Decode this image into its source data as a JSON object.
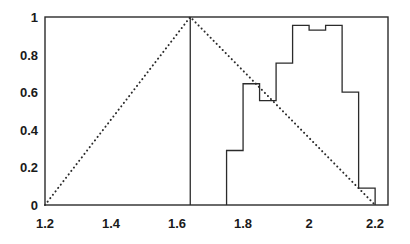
{
  "chart_data": {
    "type": "line",
    "title": "",
    "subtitle": "",
    "xlabel": "",
    "ylabel": "",
    "xlim": [
      1.2,
      2.239
    ],
    "ylim": [
      0,
      1
    ],
    "grid": false,
    "legend": null,
    "xticks": [
      1.2,
      1.4,
      1.6,
      1.8,
      2.0,
      2.2
    ],
    "xtick_labels": [
      "1.2",
      "1.4",
      "1.6",
      "1.8",
      "2",
      "2.2"
    ],
    "yticks": [
      0,
      0.2,
      0.4,
      0.6,
      0.8,
      1
    ],
    "ytick_labels": [
      "0",
      "0.2",
      "0.4",
      "0.6",
      "0.8",
      "1"
    ],
    "series": [
      {
        "name": "triangular-membership",
        "style": "dotted",
        "type": "line",
        "x": [
          1.2,
          1.64,
          2.2
        ],
        "values": [
          0,
          1,
          0
        ]
      },
      {
        "name": "empirical-histogram",
        "style": "solid-step",
        "type": "step",
        "bin_edges": [
          1.75,
          1.8,
          1.85,
          1.9,
          1.95,
          2.0,
          2.05,
          2.1,
          2.15,
          2.2
        ],
        "values": [
          0.29,
          0.645,
          0.555,
          0.755,
          0.955,
          0.93,
          0.955,
          0.6,
          0.09
        ]
      },
      {
        "name": "mode-vertical-line",
        "style": "solid-vertical",
        "type": "vline",
        "x": [
          1.64
        ],
        "values": [
          1
        ]
      }
    ]
  },
  "axes": {
    "x_tick_labels": [
      "1.2",
      "1.4",
      "1.6",
      "1.8",
      "2",
      "2.2"
    ],
    "y_tick_labels": [
      "1",
      "0.8",
      "0.6",
      "0.4",
      "0.2",
      "0"
    ]
  },
  "colors": {
    "ink": "#2b2b2b",
    "background": "#ffffff",
    "text": "#1a1a1a"
  }
}
